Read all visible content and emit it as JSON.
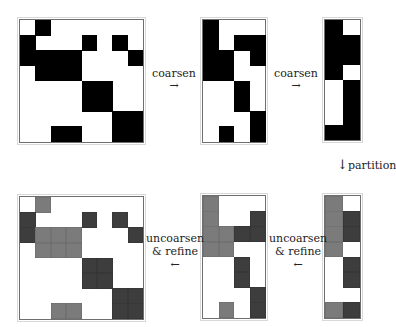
{
  "colors": {
    "black": "#000000",
    "light_gray": "#7b7b7b",
    "dark_gray": "#3d3d3d",
    "border": "#6f6f6f"
  },
  "labels": {
    "coarsen_1": "coarsen",
    "coarsen_2": "coarsen",
    "partition": "partition",
    "uncoarsen_1_line1": "uncoarsen",
    "uncoarsen_1_line2": "& refine",
    "uncoarsen_2_line1": "uncoarsen",
    "uncoarsen_2_line2": "& refine",
    "arrow_right": "→",
    "arrow_left": "←",
    "arrow_down": "↓"
  },
  "matrices": [
    {
      "id": "original",
      "x": 19,
      "y": 19,
      "cols": 8,
      "rows": 8,
      "cw": 15.4,
      "ch": 15.2,
      "grid": [
        "_b______",
        "b___b_b_",
        "bbbb___b",
        "_bbb____",
        "____bb__",
        "____bb__",
        "______bb",
        "__bb__bb"
      ]
    },
    {
      "id": "coarse1",
      "x": 202,
      "y": 19,
      "cols": 4,
      "rows": 8,
      "cw": 15.6,
      "ch": 15.2,
      "grid": [
        "b___",
        "b_bb",
        "bb_b",
        "bb__",
        "__b_",
        "__b_",
        "___b",
        "_b_b"
      ]
    },
    {
      "id": "coarse2",
      "x": 324,
      "y": 19,
      "cols": 2,
      "rows": 8,
      "cw": 17.5,
      "ch": 15.0,
      "grid": [
        "b_",
        "bb",
        "bb",
        "b_",
        "_b",
        "_b",
        "_b",
        "bb"
      ]
    },
    {
      "id": "partitioned",
      "x": 324,
      "y": 195,
      "cols": 2,
      "rows": 8,
      "cw": 17.5,
      "ch": 15.2,
      "grid": [
        "l_",
        "ld",
        "ld",
        "l_",
        "_d",
        "_d",
        "__",
        "ld"
      ]
    },
    {
      "id": "refined1",
      "x": 202,
      "y": 195,
      "cols": 4,
      "rows": 8,
      "cw": 15.6,
      "ch": 15.2,
      "grid": [
        "l___",
        "l__d",
        "lldd",
        "ll__",
        "__d_",
        "__d_",
        "___d",
        "_l_d"
      ]
    },
    {
      "id": "refined0",
      "x": 19,
      "y": 196,
      "cols": 8,
      "rows": 8,
      "cw": 15.4,
      "ch": 15.2,
      "grid": [
        "_l______",
        "d___d_d_",
        "dlll___d",
        "_lll____",
        "____dd__",
        "____dd__",
        "______dd",
        "__ll__dd"
      ]
    }
  ]
}
